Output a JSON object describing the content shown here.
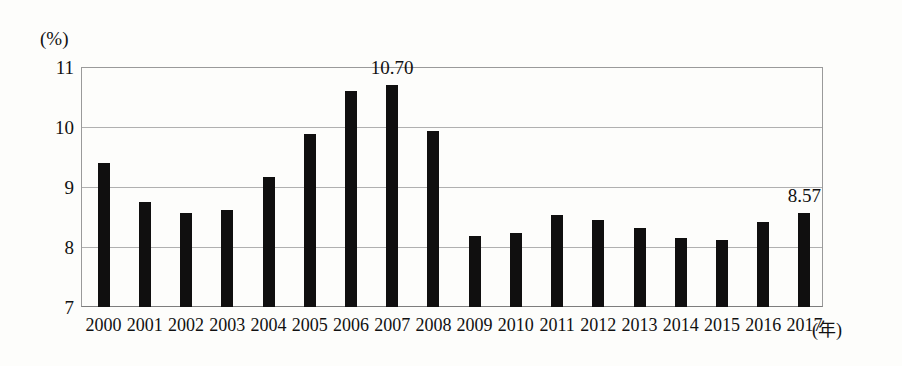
{
  "chart_data": {
    "type": "bar",
    "title": "",
    "subtitle": "",
    "xlabel": "(年)",
    "ylabel": "(%)",
    "unit_label": "(%)",
    "categories": [
      "2000",
      "2001",
      "2002",
      "2003",
      "2004",
      "2005",
      "2006",
      "2007",
      "2008",
      "2009",
      "2010",
      "2011",
      "2012",
      "2013",
      "2014",
      "2015",
      "2016",
      "2017"
    ],
    "values": [
      9.4,
      8.75,
      8.57,
      8.62,
      9.17,
      9.88,
      10.6,
      10.7,
      9.93,
      8.18,
      8.23,
      8.53,
      8.45,
      8.32,
      8.15,
      8.12,
      8.42,
      8.57
    ],
    "ylim": [
      7,
      11
    ],
    "yticks": [
      "11",
      "10",
      "9",
      "8",
      "7"
    ],
    "ytick_values": [
      11,
      10,
      9,
      8,
      7
    ],
    "grid": true,
    "legend": "none",
    "bar_color": "#100f0f",
    "grid_color": "#b0b0b0",
    "axis_color": "#7d7d7d",
    "annotations": [
      {
        "category": "2007",
        "text": "10.70",
        "value": 10.7
      },
      {
        "category": "2017",
        "text": "8.57",
        "value": 8.57
      }
    ]
  },
  "axis": {
    "y_unit": "(%)",
    "x_unit": "(年)",
    "tick_0": "11",
    "tick_1": "10",
    "tick_2": "9",
    "tick_3": "8",
    "tick_4": "7"
  }
}
